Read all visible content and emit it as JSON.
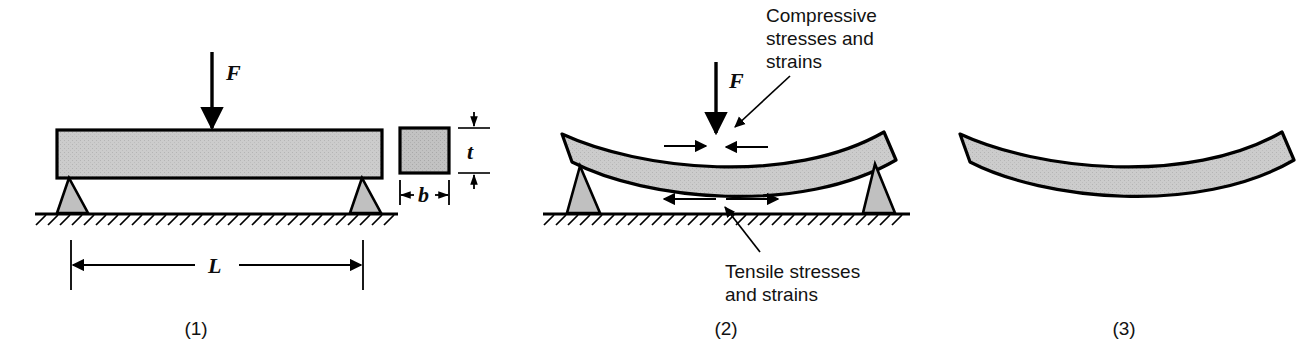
{
  "figure": {
    "background_color": "#ffffff",
    "beam_fill": "#c9c9c9",
    "beam_stroke": "#000000",
    "support_fill": "#c0c0c0",
    "line_color": "#000000"
  },
  "panels": [
    {
      "id": "panel-1",
      "caption": "(1)",
      "description": "Unloaded straight beam on two supports with applied force",
      "labels": {
        "force": "F",
        "span": "L",
        "thickness": "t",
        "width": "b"
      }
    },
    {
      "id": "panel-2",
      "caption": "(2)",
      "description": "Beam deflected under load showing compressive and tensile zones",
      "labels": {
        "force": "F"
      },
      "annotations": [
        {
          "name": "compressive-label",
          "lines": [
            "Compressive",
            "stresses and",
            "strains"
          ]
        },
        {
          "name": "tensile-label",
          "lines": [
            "Tensile stresses",
            "and strains"
          ]
        }
      ]
    },
    {
      "id": "panel-3",
      "caption": "(3)",
      "description": "Permanently deformed beam after removal of load"
    }
  ]
}
